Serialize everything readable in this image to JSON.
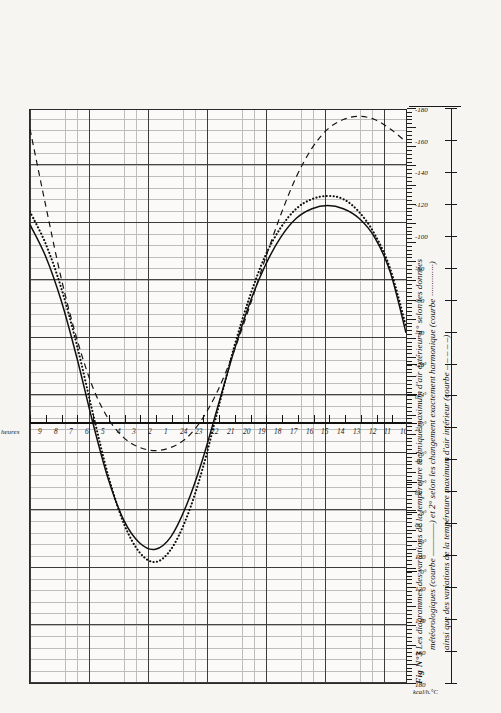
{
  "figure": {
    "number": "Fig N°3",
    "caption_line1": "Les diagrammes des variations de la température technique maximum d'air extérieur 1° selon les données",
    "caption_line2": "météorologiques (courbe ————) et 2° selon les changement exactement harmonique (courbe ··············)",
    "caption_line3": "ainsi que des variations de la température maximum d'air intérieur (courbe – – – – –)"
  },
  "axes": {
    "hours_axis_label": "heures",
    "hour_ticks": [
      "10",
      "9",
      "8",
      "7",
      "6",
      "5",
      "4",
      "3",
      "2",
      "1",
      "24",
      "23",
      "22",
      "21",
      "20",
      "19",
      "18",
      "17",
      "16",
      "15",
      "14",
      "13",
      "12",
      "11",
      "10"
    ],
    "kcal_unit": "kcal/h.°C",
    "kcal_ticks": [
      "180",
      "160",
      "140",
      "120",
      "100",
      "80",
      "60",
      "40",
      "20",
      "0",
      "-20",
      "-40",
      "-60",
      "-80",
      "-100",
      "-120",
      "-140",
      "-160",
      "-180"
    ],
    "degree_ticks": [
      "30°",
      "29°",
      "28°",
      "27°",
      "26°",
      "25°",
      "24°",
      "23°"
    ],
    "degree_zero_label": "0"
  },
  "legend": {
    "curve_meteo": "courbe ————",
    "curve_harmonic": "courbe ··············",
    "curve_interior": "courbe – – – – –"
  },
  "colors": {
    "ink": "#1a1a1a",
    "grid_major": "#262626",
    "grid_minor": "#8d8d8d",
    "paper": "#f6f5f2"
  },
  "chart_data": {
    "type": "line",
    "title": "Les diagrammes des variations de la température technique maximum d'air extérieur",
    "xlabel": "heures",
    "ylabel": "kcal/h.°C",
    "xlim": [
      10,
      34
    ],
    "ylim": [
      -180,
      180
    ],
    "grid": true,
    "legend_position": "caption",
    "x": [
      10,
      11,
      12,
      13,
      14,
      15,
      16,
      17,
      18,
      19,
      20,
      21,
      22,
      23,
      24,
      25,
      26,
      27,
      28,
      29,
      30,
      31,
      32,
      33,
      34
    ],
    "x_tick_labels": [
      "10",
      "11",
      "12",
      "13",
      "14",
      "15",
      "16",
      "17",
      "18",
      "19",
      "20",
      "21",
      "22",
      "23",
      "24",
      "1",
      "2",
      "3",
      "4",
      "5",
      "6",
      "7",
      "8",
      "9",
      "10"
    ],
    "series": [
      {
        "name": "Température technique maximum d'air extérieur — données météorologiques",
        "style": "solid",
        "values": [
          -108,
          -88,
          -60,
          -24,
          16,
          52,
          78,
          92,
          96,
          88,
          68,
          40,
          6,
          -28,
          -58,
          -82,
          -100,
          -112,
          -118,
          -120,
          -118,
          -112,
          -100,
          -78,
          -40
        ]
      },
      {
        "name": "Température technique maximum d'air extérieur — changement exactement harmonique",
        "style": "dotted",
        "values": [
          -116,
          -96,
          -68,
          -32,
          10,
          50,
          80,
          98,
          104,
          96,
          76,
          46,
          8,
          -30,
          -62,
          -88,
          -106,
          -118,
          -124,
          -126,
          -124,
          -116,
          -102,
          -80,
          -44
        ]
      },
      {
        "name": "Température maximum d'air intérieur",
        "style": "dashed",
        "values": [
          -168,
          -120,
          -74,
          -36,
          -6,
          14,
          26,
          32,
          34,
          32,
          26,
          14,
          -4,
          -28,
          -56,
          -86,
          -114,
          -138,
          -156,
          -168,
          -174,
          -176,
          -174,
          -168,
          -160
        ]
      }
    ]
  }
}
